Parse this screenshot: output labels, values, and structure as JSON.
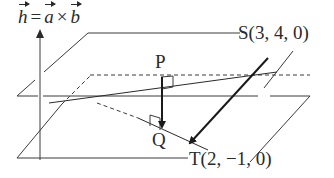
{
  "formula": {
    "lhs": "h",
    "equals": "=",
    "a": "a",
    "times": "×",
    "b": "b",
    "text": "h = a × b"
  },
  "points": {
    "S": "S(3, 4, 0)",
    "T": "T(2, −1, 0)",
    "P": "P",
    "Q": "Q"
  },
  "colors": {
    "line": "#3a3a3a",
    "arrow": "#1a1a1a",
    "background": "#ffffff"
  }
}
